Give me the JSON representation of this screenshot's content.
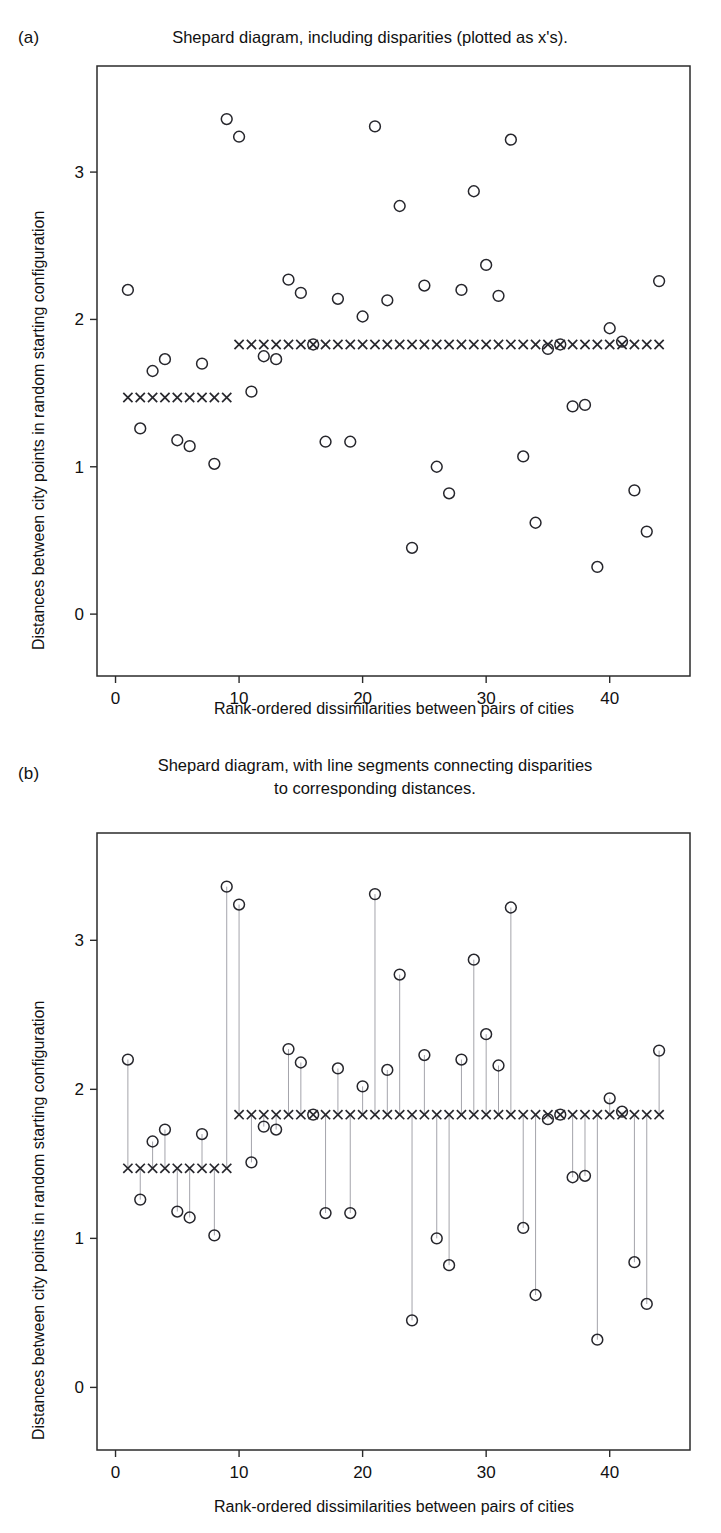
{
  "figure": {
    "panels": [
      {
        "letter": "(a)",
        "title": "Shepard diagram, including disparities (plotted as x's)."
      },
      {
        "letter": "(b)",
        "title": "Shepard diagram, with line segments connecting disparities\nto corresponding distances."
      }
    ],
    "axis": {
      "xlabel": "Rank-ordered dissimilarities between pairs of cities",
      "ylabel": "Distances between city points in random starting configuration",
      "xticks": [
        "0",
        "10",
        "20",
        "30",
        "40"
      ],
      "yticks": [
        "0",
        "1",
        "2",
        "3"
      ]
    },
    "colors": {
      "ink": "#26262c",
      "frame": "#2b2b2b",
      "segment": "#9a9aa2",
      "background": "#ffffff"
    }
  },
  "chart_data": [
    {
      "type": "scatter",
      "panel": "(a)",
      "title": "Shepard diagram, including disparities (plotted as x's).",
      "xlabel": "Rank-ordered dissimilarities between pairs of cities",
      "ylabel": "Distances between city points in random starting configuration",
      "xlim": [
        -1.5,
        46.5
      ],
      "ylim": [
        -0.42,
        3.72
      ],
      "xticks": [
        0,
        10,
        20,
        30,
        40
      ],
      "yticks": [
        0,
        1,
        2,
        3
      ],
      "grid": false,
      "legend": null,
      "series": [
        {
          "name": "distances",
          "marker": "open-circle",
          "x": [
            1,
            2,
            3,
            4,
            5,
            6,
            7,
            8,
            9,
            10,
            11,
            12,
            13,
            14,
            15,
            16,
            17,
            18,
            19,
            20,
            21,
            22,
            23,
            24,
            25,
            26,
            27,
            28,
            29,
            30,
            31,
            32,
            33,
            34,
            35,
            36,
            37,
            38,
            39,
            40,
            41,
            42,
            43,
            44
          ],
          "y": [
            2.2,
            1.26,
            1.65,
            1.73,
            1.18,
            1.14,
            1.7,
            1.02,
            3.36,
            3.24,
            1.51,
            1.75,
            1.73,
            2.27,
            2.18,
            1.83,
            1.17,
            2.14,
            1.17,
            2.02,
            3.31,
            2.13,
            2.77,
            0.45,
            2.23,
            1.0,
            0.82,
            2.2,
            2.87,
            2.37,
            2.16,
            3.22,
            1.07,
            0.62,
            1.8,
            1.83,
            1.41,
            1.42,
            0.32,
            1.94,
            1.85,
            0.84,
            0.56,
            2.26,
            2.88
          ]
        },
        {
          "name": "disparities",
          "marker": "x",
          "x": [
            1,
            2,
            3,
            4,
            5,
            6,
            7,
            8,
            9,
            10,
            11,
            12,
            13,
            14,
            15,
            16,
            17,
            18,
            19,
            20,
            21,
            22,
            23,
            24,
            25,
            26,
            27,
            28,
            29,
            30,
            31,
            32,
            33,
            34,
            35,
            36,
            37,
            38,
            39,
            40,
            41,
            42,
            43,
            44
          ],
          "y": [
            1.47,
            1.47,
            1.47,
            1.47,
            1.47,
            1.47,
            1.47,
            1.47,
            1.47,
            1.83,
            1.83,
            1.83,
            1.83,
            1.83,
            1.83,
            1.83,
            1.83,
            1.83,
            1.83,
            1.83,
            1.83,
            1.83,
            1.83,
            1.83,
            1.83,
            1.83,
            1.83,
            1.83,
            1.83,
            1.83,
            1.83,
            1.83,
            1.83,
            1.83,
            1.83,
            1.83,
            1.83,
            1.83,
            1.83,
            1.83,
            1.83,
            1.83,
            1.83,
            1.83
          ]
        }
      ],
      "coincident_points": [
        16,
        36,
        41,
        44,
        45
      ],
      "annotations": []
    },
    {
      "type": "scatter",
      "panel": "(b)",
      "title": "Shepard diagram, with line segments connecting disparities to corresponding distances.",
      "xlabel": "Rank-ordered dissimilarities between pairs of cities",
      "ylabel": "Distances between city points in random starting configuration",
      "xlim": [
        -1.5,
        46.5
      ],
      "ylim": [
        -0.42,
        3.72
      ],
      "xticks": [
        0,
        10,
        20,
        30,
        40
      ],
      "yticks": [
        0,
        1,
        2,
        3
      ],
      "grid": false,
      "legend": null,
      "connectors": true,
      "series": [
        {
          "name": "distances",
          "marker": "open-circle",
          "x": [
            1,
            2,
            3,
            4,
            5,
            6,
            7,
            8,
            9,
            10,
            11,
            12,
            13,
            14,
            15,
            16,
            17,
            18,
            19,
            20,
            21,
            22,
            23,
            24,
            25,
            26,
            27,
            28,
            29,
            30,
            31,
            32,
            33,
            34,
            35,
            36,
            37,
            38,
            39,
            40,
            41,
            42,
            43,
            44
          ],
          "y": [
            2.2,
            1.26,
            1.65,
            1.73,
            1.18,
            1.14,
            1.7,
            1.02,
            3.36,
            3.24,
            1.51,
            1.75,
            1.73,
            2.27,
            2.18,
            1.83,
            1.17,
            2.14,
            1.17,
            2.02,
            3.31,
            2.13,
            2.77,
            0.45,
            2.23,
            1.0,
            0.82,
            2.2,
            2.87,
            2.37,
            2.16,
            3.22,
            1.07,
            0.62,
            1.8,
            1.83,
            1.41,
            1.42,
            0.32,
            1.94,
            1.85,
            0.84,
            0.56,
            2.26,
            2.88
          ]
        },
        {
          "name": "disparities",
          "marker": "x",
          "x": [
            1,
            2,
            3,
            4,
            5,
            6,
            7,
            8,
            9,
            10,
            11,
            12,
            13,
            14,
            15,
            16,
            17,
            18,
            19,
            20,
            21,
            22,
            23,
            24,
            25,
            26,
            27,
            28,
            29,
            30,
            31,
            32,
            33,
            34,
            35,
            36,
            37,
            38,
            39,
            40,
            41,
            42,
            43,
            44
          ],
          "y": [
            1.47,
            1.47,
            1.47,
            1.47,
            1.47,
            1.47,
            1.47,
            1.47,
            1.47,
            1.83,
            1.83,
            1.83,
            1.83,
            1.83,
            1.83,
            1.83,
            1.83,
            1.83,
            1.83,
            1.83,
            1.83,
            1.83,
            1.83,
            1.83,
            1.83,
            1.83,
            1.83,
            1.83,
            1.83,
            1.83,
            1.83,
            1.83,
            1.83,
            1.83,
            1.83,
            1.83,
            1.83,
            1.83,
            1.83,
            1.83,
            1.83,
            1.83,
            1.83,
            1.83
          ]
        }
      ],
      "coincident_points": [
        16,
        36,
        41,
        44,
        45
      ],
      "annotations": []
    }
  ]
}
